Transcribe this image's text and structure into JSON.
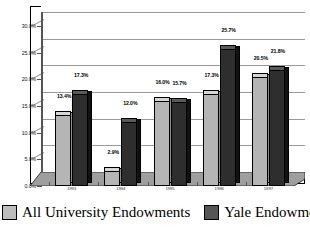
{
  "chart_data": {
    "type": "bar",
    "title": "",
    "subtitle": "",
    "xlabel": "",
    "ylabel": "",
    "ylim": [
      0,
      30
    ],
    "ytick_labels": [
      "0.0%",
      "5.0%",
      "10.0%",
      "15.0%",
      "20.0%",
      "25.0%",
      "30.0%"
    ],
    "ytick_values": [
      0,
      5,
      10,
      15,
      20,
      25,
      30
    ],
    "grid": true,
    "legend_position": "bottom",
    "categories": [
      "1993",
      "1994",
      "1995",
      "1996",
      "1997"
    ],
    "series": [
      {
        "name": "All University Endowments",
        "color": "#b5b5b5",
        "values": [
          13.4,
          2.9,
          16.0,
          17.3,
          20.5
        ],
        "labels": [
          "13.4%",
          "2.9%",
          "16.0%",
          "17.3%",
          "20.5%"
        ]
      },
      {
        "name": "Yale Endowment",
        "color": "#2e2e2e",
        "values": [
          17.3,
          12.0,
          15.7,
          25.7,
          21.8
        ],
        "labels": [
          "17.3%",
          "12.0%",
          "15.7%",
          "25.7%",
          "21.8%"
        ]
      }
    ]
  },
  "legend": {
    "items": [
      {
        "label": "All University Endowments",
        "swatch": "light"
      },
      {
        "label": "Yale Endowment",
        "swatch": "dark"
      }
    ]
  }
}
